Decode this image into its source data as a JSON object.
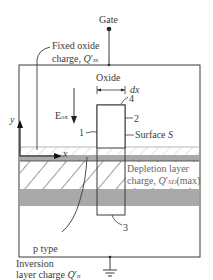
{
  "diagram": {
    "terminals": {
      "gate": "Gate"
    },
    "labels": {
      "fixed_oxide_line1": "Fixed oxide",
      "fixed_oxide_line2": "charge, Q'ss",
      "oxide": "Oxide",
      "dx": "dx",
      "num1": "1",
      "num2": "2",
      "num3": "3",
      "num4": "4",
      "field": "Eox",
      "surface": "Surface S",
      "axis_y": "y",
      "axis_x": "x",
      "depletion_line1": "Depletion layer",
      "depletion_line2": "charge, Q'SD(max)",
      "ptype": "p type",
      "inversion_line1": "Inversion",
      "inversion_line2": "layer charge Q'n"
    },
    "colors": {
      "outline": "#3a3a3a",
      "inversion_band": "#a9a9a9",
      "gray_band": "#a9a9a9",
      "hatch": "#3a3a3a"
    }
  }
}
